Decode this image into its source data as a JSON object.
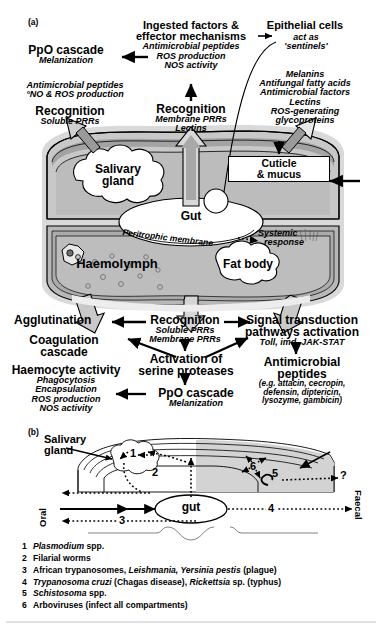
{
  "panel_a": {
    "label": "(a)",
    "top_center": {
      "title_line1": "Ingested factors &",
      "title_line2": "effector mechanisms",
      "items": [
        "Antimicrobial peptides",
        "ROS production",
        "NOS activity"
      ]
    },
    "recognition_center": {
      "title": "Recognition",
      "items": [
        "Membrane PRRs",
        "Lectins"
      ]
    },
    "top_left": {
      "ppo_title": "PpO cascade",
      "ppo_sub": "Melanization",
      "amp_line1": "Antimicrobial peptides",
      "amp_line2": "°NO & ROS production",
      "recognition_title": "Recognition",
      "recognition_sub": "Soluble PRRs"
    },
    "top_right": {
      "title": "Epithelial cells",
      "sub_line1": "act as",
      "sub_line2": "'sentinels'",
      "items": [
        "Melanins",
        "Antifungal fatty acids",
        "Antimicrobial factors",
        "Lectins",
        "ROS-generating",
        "glycoproteins"
      ]
    },
    "body": {
      "salivary_gland": "Salivary\ngland",
      "salivary_gland_l1": "Salivary",
      "salivary_gland_l2": "gland",
      "gut": "Gut",
      "peritrophic_membrane": "Peritrophic membrane",
      "systemic_response_l1": "Systemic",
      "systemic_response_l2": "response",
      "haemolymph": "Haemolymph",
      "fat_body": "Fat body",
      "cuticle_l1": "Cuticle",
      "cuticle_l2": "& mucus"
    },
    "bottom": {
      "agglutination": "Agglutination",
      "coagulation_l1": "Coagulation",
      "coagulation_l2": "cascade",
      "haemocyte_title": "Haemocyte activity",
      "haemocyte_items": [
        "Phagocytosis",
        "Encapsulation",
        "ROS production",
        "NOS activity"
      ],
      "recognition_title": "Recognition",
      "recognition_items": [
        "Soluble PRRs",
        "Membrane PRRs"
      ],
      "activation_l1": "Activation of",
      "activation_l2": "serine proteases",
      "ppo_title": "PpO cascade",
      "ppo_sub": "Melanization",
      "signal_l1": "Signal transduction",
      "signal_l2": "pathways activation",
      "signal_sub": "Toll, imd, JAK-STAT",
      "amp_l1": "Antimicrobial",
      "amp_l2": "peptides",
      "amp_sub_l1": "(e.g. attacin, cecropin,",
      "amp_sub_l2": "defensin, diptericin,",
      "amp_sub_l3": "lysozyme, gambicin)"
    }
  },
  "panel_b": {
    "label": "(b)",
    "salivary_gland_l1": "Salivary",
    "salivary_gland_l2": "gland",
    "gut": "gut",
    "oral": "Oral",
    "faecal": "Faecal",
    "question_mark": "?",
    "route_numbers": [
      "1",
      "2",
      "3",
      "4",
      "5",
      "6"
    ]
  },
  "legend": {
    "items": [
      {
        "num": "1",
        "parts": [
          {
            "t": "Plasmodium",
            "italic": true
          },
          {
            "t": " spp.",
            "italic": false
          }
        ]
      },
      {
        "num": "2",
        "parts": [
          {
            "t": "Filarial worms",
            "italic": false
          }
        ]
      },
      {
        "num": "3",
        "parts": [
          {
            "t": "African trypanosomes, ",
            "italic": false
          },
          {
            "t": "Leishmania, Yersinia pestis",
            "italic": true
          },
          {
            "t": " (plague)",
            "italic": false
          }
        ]
      },
      {
        "num": "4",
        "parts": [
          {
            "t": "Trypanosoma cruzi",
            "italic": true
          },
          {
            "t": " (Chagas disease), ",
            "italic": false
          },
          {
            "t": "Rickettsia",
            "italic": true
          },
          {
            "t": " sp. (typhus)",
            "italic": false
          }
        ]
      },
      {
        "num": "5",
        "parts": [
          {
            "t": "Schistosoma",
            "italic": true
          },
          {
            "t": " spp.",
            "italic": false
          }
        ]
      },
      {
        "num": "6",
        "parts": [
          {
            "t": "Arboviruses (infect all compartments)",
            "italic": false
          }
        ]
      }
    ]
  },
  "colors": {
    "outer_body": "#d6d6d6",
    "cuticle_band": "#a9a9a9",
    "interior": "#bdbdbd",
    "interior_dark": "#b0b0b0",
    "arrow_fill": "#b5b5b5",
    "white": "#ffffff",
    "stroke": "#000000"
  }
}
